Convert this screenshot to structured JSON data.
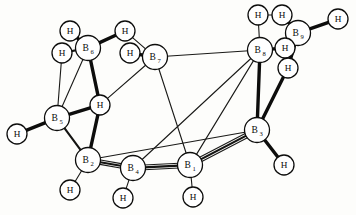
{
  "figure": {
    "kind": "molecular-structure-diagram",
    "background_color": "#fdfdfb",
    "line_color": "#0d0d0c",
    "atom_fill_color": "#ffffff",
    "width": 356,
    "height": 215
  },
  "atoms": [
    {
      "id": "B1",
      "element": "B",
      "index": "1",
      "label": "B",
      "sub": "1",
      "x": 190,
      "y": 165,
      "r": 12.5
    },
    {
      "id": "B2",
      "element": "B",
      "index": "2",
      "label": "B",
      "sub": "2",
      "x": 88,
      "y": 160,
      "r": 12.5
    },
    {
      "id": "B3",
      "element": "B",
      "index": "3",
      "label": "B",
      "sub": "3",
      "x": 257,
      "y": 130,
      "r": 12.5
    },
    {
      "id": "B4",
      "element": "B",
      "index": "4",
      "label": "B",
      "sub": "4",
      "x": 133,
      "y": 168,
      "r": 12.5
    },
    {
      "id": "B5",
      "element": "B",
      "index": "5",
      "label": "B",
      "sub": "5",
      "x": 57,
      "y": 118,
      "r": 12.5
    },
    {
      "id": "B6",
      "element": "B",
      "index": "6",
      "label": "B",
      "sub": "6",
      "x": 88,
      "y": 48,
      "r": 12.5
    },
    {
      "id": "B7",
      "element": "B",
      "index": "7",
      "label": "B",
      "sub": "7",
      "x": 155,
      "y": 57,
      "r": 12.5
    },
    {
      "id": "B8",
      "element": "B",
      "index": "8",
      "label": "B",
      "sub": "8",
      "x": 260,
      "y": 50,
      "r": 12.5
    },
    {
      "id": "B9",
      "element": "B",
      "index": "9",
      "label": "B",
      "sub": "9",
      "x": 298,
      "y": 33,
      "r": 12.5
    },
    {
      "id": "H1",
      "element": "H",
      "label": "H",
      "x": 70,
      "y": 31,
      "r": 10.0
    },
    {
      "id": "H2",
      "element": "H",
      "label": "H",
      "x": 62,
      "y": 53,
      "r": 10.0
    },
    {
      "id": "H3",
      "element": "H",
      "label": "H",
      "x": 125,
      "y": 31,
      "r": 10.0
    },
    {
      "id": "H4",
      "element": "H",
      "label": "H",
      "x": 130,
      "y": 53,
      "r": 10.0
    },
    {
      "id": "H5",
      "element": "H",
      "label": "H",
      "x": 100,
      "y": 105,
      "r": 10.0
    },
    {
      "id": "H6",
      "element": "H",
      "label": "H",
      "x": 17,
      "y": 134,
      "r": 10.0
    },
    {
      "id": "H7",
      "element": "H",
      "label": "H",
      "x": 70,
      "y": 190,
      "r": 10.0
    },
    {
      "id": "H8",
      "element": "H",
      "label": "H",
      "x": 123,
      "y": 198,
      "r": 10.0
    },
    {
      "id": "H9",
      "element": "H",
      "label": "H",
      "x": 193,
      "y": 197,
      "r": 10.0
    },
    {
      "id": "H10",
      "element": "H",
      "label": "H",
      "x": 284,
      "y": 165,
      "r": 10.0
    },
    {
      "id": "H11",
      "element": "H",
      "label": "H",
      "x": 288,
      "y": 68,
      "r": 10.0
    },
    {
      "id": "H12",
      "element": "H",
      "label": "H",
      "x": 285,
      "y": 48,
      "r": 10.0
    },
    {
      "id": "H13",
      "element": "H",
      "label": "H",
      "x": 258,
      "y": 15,
      "r": 10.0
    },
    {
      "id": "H14",
      "element": "H",
      "label": "H",
      "x": 282,
      "y": 15,
      "r": 10.0
    },
    {
      "id": "H15",
      "element": "H",
      "label": "H",
      "x": 338,
      "y": 19,
      "r": 10.0
    }
  ],
  "bonds": [
    {
      "from": "B6",
      "to": "H1",
      "weight": "thick"
    },
    {
      "from": "B6",
      "to": "H2",
      "weight": "medium"
    },
    {
      "from": "B6",
      "to": "H3",
      "weight": "thick"
    },
    {
      "from": "B6",
      "to": "H5",
      "weight": "thick"
    },
    {
      "from": "H5",
      "to": "B2",
      "weight": "thick"
    },
    {
      "from": "B6",
      "to": "B5",
      "weight": "thin"
    },
    {
      "from": "H2",
      "to": "B5",
      "weight": "thin"
    },
    {
      "from": "B5",
      "to": "H6",
      "weight": "thick"
    },
    {
      "from": "B5",
      "to": "H5",
      "weight": "thick"
    },
    {
      "from": "B5",
      "to": "B2",
      "weight": "medium"
    },
    {
      "from": "B2",
      "to": "H7",
      "weight": "thin"
    },
    {
      "from": "B2",
      "to": "B4",
      "weight": "medium"
    },
    {
      "from": "B4",
      "to": "H8",
      "weight": "thin"
    },
    {
      "from": "B4",
      "to": "B1",
      "weight": "medium"
    },
    {
      "from": "B1",
      "to": "H9",
      "weight": "thin"
    },
    {
      "from": "B1",
      "to": "B3",
      "weight": "medium"
    },
    {
      "from": "B3",
      "to": "H10",
      "weight": "thick"
    },
    {
      "from": "B3",
      "to": "B8",
      "weight": "thick"
    },
    {
      "from": "B3",
      "to": "H11",
      "weight": "thick"
    },
    {
      "from": "B7",
      "to": "H3",
      "weight": "thin"
    },
    {
      "from": "B7",
      "to": "H4",
      "weight": "thick"
    },
    {
      "from": "B7",
      "to": "B8",
      "weight": "thin"
    },
    {
      "from": "B7",
      "to": "B1",
      "weight": "thin"
    },
    {
      "from": "B7",
      "to": "H5",
      "weight": "thin"
    },
    {
      "from": "B8",
      "to": "B1",
      "weight": "thin"
    },
    {
      "from": "B8",
      "to": "B4",
      "weight": "thin"
    },
    {
      "from": "B8",
      "to": "H13",
      "weight": "thin"
    },
    {
      "from": "B8",
      "to": "H12",
      "weight": "thick"
    },
    {
      "from": "B9",
      "to": "H12",
      "weight": "thick"
    },
    {
      "from": "B9",
      "to": "H14",
      "weight": "thick"
    },
    {
      "from": "B9",
      "to": "H15",
      "weight": "thick"
    },
    {
      "from": "B9",
      "to": "H11",
      "weight": "thick"
    },
    {
      "from": "H13",
      "to": "H14",
      "weight": "thin"
    },
    {
      "from": "B2",
      "to": "B3",
      "weight": "thin"
    }
  ],
  "double_bonds": [
    {
      "from": "B2",
      "to": "B4",
      "offset": 2.2
    },
    {
      "from": "B4",
      "to": "B1",
      "offset": 2.4
    },
    {
      "from": "B1",
      "to": "B3",
      "offset": 2.4
    }
  ]
}
